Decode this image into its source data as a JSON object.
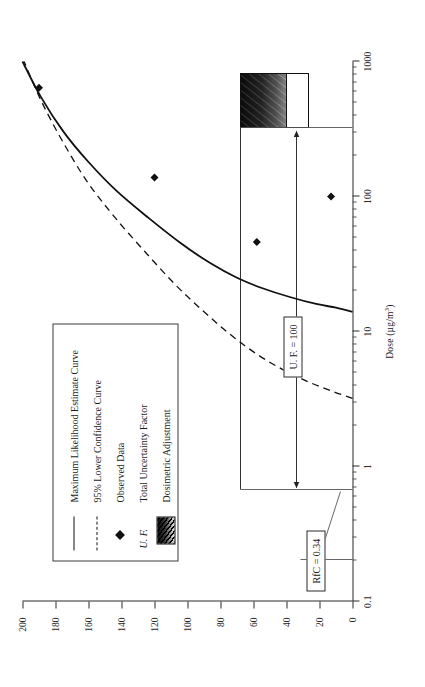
{
  "figure": {
    "orientation": "landscape-rotated-90ccw",
    "background": "#ffffff",
    "ink": "#1a1a1a"
  },
  "chart_data": {
    "type": "line",
    "title": "",
    "xlabel": "Dose (µg/m³)",
    "ylabel": "",
    "xscale": "log",
    "xlim": [
      0.1,
      1000
    ],
    "ylim": [
      0,
      200
    ],
    "grid": false,
    "legend_position": "upper-left-inside",
    "xticks": [
      0.1,
      1,
      10,
      100,
      1000
    ],
    "xtick_labels": [
      "0.1",
      "1",
      "10",
      "100",
      "1000"
    ],
    "yticks": [
      0,
      20,
      40,
      60,
      80,
      100,
      120,
      140,
      160,
      180,
      200
    ],
    "ytick_labels": [
      "0",
      "20",
      "40",
      "60",
      "80",
      "100",
      "120",
      "140",
      "160",
      "180",
      "200"
    ],
    "series": [
      {
        "name": "Maximum Likelihood Estimate Curve",
        "style": "solid",
        "color": "#111111",
        "points": [
          [
            14,
            0
          ],
          [
            15,
            10
          ],
          [
            16,
            22
          ],
          [
            18,
            38
          ],
          [
            21,
            55
          ],
          [
            25,
            70
          ],
          [
            32,
            86
          ],
          [
            45,
            104
          ],
          [
            70,
            124
          ],
          [
            110,
            143
          ],
          [
            180,
            160
          ],
          [
            300,
            175
          ],
          [
            550,
            189
          ],
          [
            1000,
            200
          ]
        ]
      },
      {
        "name": "95% Lower Confidence Curve",
        "style": "dashed",
        "color": "#111111",
        "points": [
          [
            3.2,
            0
          ],
          [
            3.6,
            12
          ],
          [
            4.2,
            26
          ],
          [
            5.2,
            42
          ],
          [
            6.8,
            58
          ],
          [
            9.5,
            74
          ],
          [
            14,
            90
          ],
          [
            22,
            107
          ],
          [
            38,
            125
          ],
          [
            70,
            144
          ],
          [
            130,
            161
          ],
          [
            260,
            176
          ],
          [
            520,
            189
          ],
          [
            1000,
            199
          ]
        ]
      }
    ],
    "scatter": [
      {
        "name": "Observed Data",
        "marker": "diamond",
        "color": "#111111",
        "points": [
          [
            100,
            13
          ],
          [
            46,
            58
          ],
          [
            138,
            120
          ],
          [
            640,
            190
          ]
        ]
      }
    ],
    "annotations": [
      {
        "name": "uf-note",
        "text": "U. F. = 100",
        "boxed": true
      },
      {
        "name": "rfc-note",
        "text": "RfC = 0.34",
        "boxed": true
      },
      {
        "name": "uf-arrow",
        "text": "",
        "from_x": 0.34,
        "to_x": 34,
        "at_y": 68
      }
    ],
    "shaded_regions": [
      {
        "name": "Dosimetric Adjustment",
        "pattern": "diagonal-hatch",
        "x_range": [
          14,
          34
        ],
        "y_range": [
          0,
          68
        ]
      }
    ]
  },
  "legend": {
    "items": [
      {
        "key": "solid-line",
        "label": "Maximum Likelihood Estimate Curve"
      },
      {
        "key": "dashed-line",
        "label": "95% Lower Confidence Curve"
      },
      {
        "key": "diamond-marker",
        "label": "Observed Data"
      },
      {
        "key": "uf-abbrev",
        "prefix": "U. F.",
        "label": "Total Uncertainty Factor"
      },
      {
        "key": "hatch-swatch",
        "label": "Dosimetric Adjustment"
      }
    ]
  },
  "axis": {
    "x_title_main": "Dose (µg/m",
    "x_title_sup": "3",
    "x_title_close": ")"
  }
}
